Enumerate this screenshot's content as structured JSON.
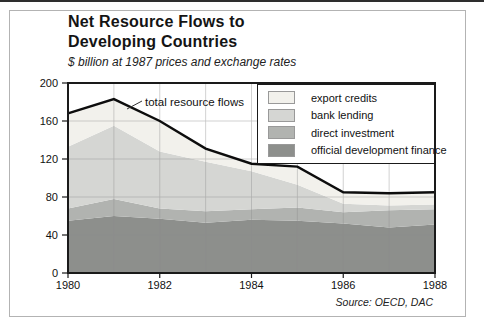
{
  "header": {
    "title_line1": "Net Resource Flows to",
    "title_line2": "Developing Countries",
    "subtitle": "$ billion at 1987 prices and exchange rates"
  },
  "source": "Source: OECD, DAC",
  "chart_data": {
    "type": "area",
    "stacked": true,
    "x": [
      1980,
      1981,
      1982,
      1983,
      1984,
      1985,
      1986,
      1987,
      1988
    ],
    "x_tick_labels": [
      "1980",
      "1982",
      "1984",
      "1986",
      "1988"
    ],
    "y_ticks": [
      0,
      40,
      80,
      120,
      160,
      200
    ],
    "ylim": [
      0,
      200
    ],
    "grid": true,
    "legend_position": "top-right",
    "series": [
      {
        "id": "official-development-finance",
        "name": "official development finance",
        "color": "#8d8f8c",
        "values": [
          55,
          60,
          57,
          53,
          56,
          55,
          52,
          48,
          51
        ]
      },
      {
        "id": "direct-investment",
        "name": "direct investment",
        "color": "#b1b3b0",
        "values": [
          13,
          18,
          11,
          12,
          11,
          14,
          12,
          18,
          16
        ]
      },
      {
        "id": "bank-lending",
        "name": "bank lending",
        "color": "#d5d6d3",
        "values": [
          65,
          77,
          60,
          52,
          40,
          24,
          9,
          5,
          5
        ]
      },
      {
        "id": "export-credits",
        "name": "export credits",
        "color": "#f2f1ec",
        "values": [
          35,
          28,
          32,
          14,
          8,
          19,
          12,
          13,
          13
        ]
      }
    ],
    "total_line": {
      "name": "total resource flows",
      "color": "#0d0d0d",
      "values": [
        168,
        183,
        160,
        131,
        115,
        112,
        85,
        84,
        85
      ]
    },
    "legend": [
      {
        "label": "export credits",
        "color": "#f2f1ec"
      },
      {
        "label": "bank lending",
        "color": "#d5d6d3"
      },
      {
        "label": "direct investment",
        "color": "#b1b3b0"
      },
      {
        "label": "official development finance",
        "color": "#8d8f8c"
      }
    ],
    "colors": {
      "frame": "#1a1a1a",
      "grid": "#8c8c8c",
      "axis_text": "#111111"
    }
  }
}
